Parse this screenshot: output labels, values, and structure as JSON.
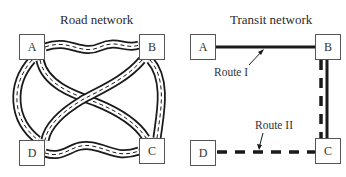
{
  "road_network": {
    "title": "Road network",
    "nodes": [
      {
        "id": "A",
        "label": "A"
      },
      {
        "id": "B",
        "label": "B"
      },
      {
        "id": "C",
        "label": "C"
      },
      {
        "id": "D",
        "label": "D"
      }
    ],
    "links": [
      {
        "from": "A",
        "to": "B",
        "style": "road"
      },
      {
        "from": "A",
        "to": "C",
        "style": "road"
      },
      {
        "from": "A",
        "to": "D",
        "style": "road"
      },
      {
        "from": "B",
        "to": "C",
        "style": "road"
      },
      {
        "from": "B",
        "to": "D",
        "style": "road"
      },
      {
        "from": "D",
        "to": "C",
        "style": "road"
      }
    ]
  },
  "transit_network": {
    "title": "Transit network",
    "nodes": [
      {
        "id": "A",
        "label": "A"
      },
      {
        "id": "B",
        "label": "B"
      },
      {
        "id": "C",
        "label": "C"
      },
      {
        "id": "D",
        "label": "D"
      }
    ],
    "routes": [
      {
        "name": "Route I",
        "path": [
          "A",
          "B",
          "C"
        ],
        "style": "solid"
      },
      {
        "name": "Route II",
        "path": [
          "B",
          "C",
          "D"
        ],
        "style": "dashed"
      }
    ]
  },
  "colors": {
    "line": "#1a1a1a",
    "node_border": "#555555",
    "background": "#ffffff"
  }
}
